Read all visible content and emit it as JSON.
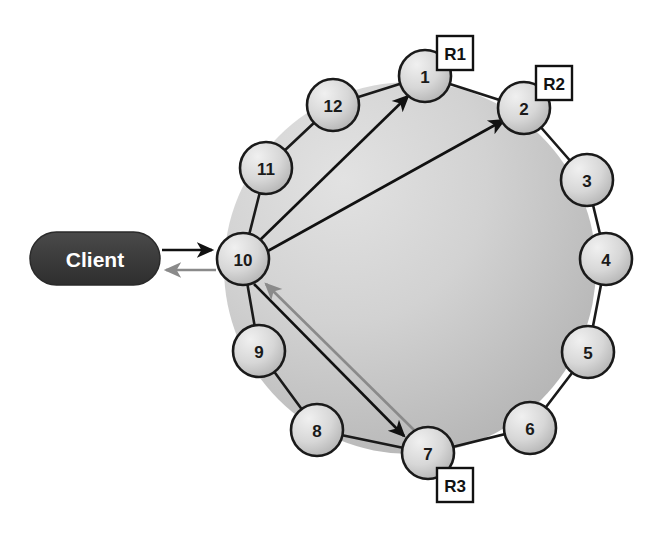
{
  "diagram": {
    "type": "ring-topology",
    "background_color": "#ffffff",
    "ring": {
      "center_x": 410,
      "center_y": 268,
      "radius": 185,
      "fill_light": "#d8d8d8",
      "fill_dark": "#b8b8b8",
      "stroke": "#1a1a1a"
    },
    "node_style": {
      "radius": 26,
      "fill_light": "#e8e8e8",
      "fill_dark": "#b9b9b9",
      "stroke": "#1a1a1a",
      "stroke_width": 2.5
    },
    "nodes": [
      {
        "id": "node-1",
        "label": "1",
        "x": 425,
        "y": 76,
        "replica": "R1"
      },
      {
        "id": "node-2",
        "label": "2",
        "x": 524,
        "y": 108,
        "replica": "R2"
      },
      {
        "id": "node-3",
        "label": "3",
        "x": 587,
        "y": 180,
        "replica": null
      },
      {
        "id": "node-4",
        "label": "4",
        "x": 606,
        "y": 259,
        "replica": null
      },
      {
        "id": "node-5",
        "label": "5",
        "x": 588,
        "y": 352,
        "replica": null
      },
      {
        "id": "node-6",
        "label": "6",
        "x": 530,
        "y": 428,
        "replica": null
      },
      {
        "id": "node-7",
        "label": "7",
        "x": 428,
        "y": 453,
        "replica": "R3"
      },
      {
        "id": "node-8",
        "label": "8",
        "x": 317,
        "y": 430,
        "replica": null
      },
      {
        "id": "node-9",
        "label": "9",
        "x": 259,
        "y": 351,
        "replica": null
      },
      {
        "id": "node-10",
        "label": "10",
        "x": 243,
        "y": 259,
        "replica": null
      },
      {
        "id": "node-11",
        "label": "11",
        "x": 266,
        "y": 168,
        "replica": null
      },
      {
        "id": "node-12",
        "label": "12",
        "x": 333,
        "y": 105,
        "replica": null
      }
    ],
    "replica_boxes": [
      {
        "id": "replica-box-r1",
        "label": "R1",
        "x": 437,
        "y": 36,
        "w": 36,
        "h": 34
      },
      {
        "id": "replica-box-r2",
        "label": "R2",
        "x": 536,
        "y": 66,
        "w": 36,
        "h": 34
      },
      {
        "id": "replica-box-r3",
        "label": "R3",
        "x": 437,
        "y": 468,
        "w": 36,
        "h": 34
      }
    ],
    "client": {
      "label": "Client",
      "x": 30,
      "y": 232,
      "width": 130,
      "height": 53,
      "fill": "#3d3d3d",
      "text_color": "#ffffff"
    },
    "request_arrows": [
      {
        "id": "arrow-client-to-10",
        "from": "Client",
        "to": "10",
        "color": "#111111",
        "style": "solid"
      },
      {
        "id": "arrow-10-to-1",
        "from": "10",
        "to": "1",
        "color": "#111111",
        "style": "solid"
      },
      {
        "id": "arrow-10-to-2",
        "from": "10",
        "to": "2",
        "color": "#111111",
        "style": "solid"
      },
      {
        "id": "arrow-10-to-7",
        "from": "10",
        "to": "7",
        "color": "#111111",
        "style": "solid"
      },
      {
        "id": "arrow-7-to-10",
        "from": "7",
        "to": "10",
        "color": "#8a8a8a",
        "style": "solid"
      },
      {
        "id": "arrow-10-to-client",
        "from": "10",
        "to": "Client",
        "color": "#8a8a8a",
        "style": "solid"
      }
    ],
    "colors": {
      "stroke": "#1a1a1a",
      "arrow_black": "#111111",
      "arrow_gray": "#8a8a8a",
      "node_fill": "#dcdcdc",
      "ring_fill": "#cfcfcf",
      "client_fill": "#3d3d3d"
    }
  }
}
